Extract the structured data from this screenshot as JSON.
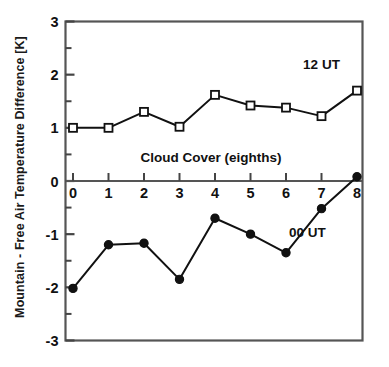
{
  "chart_data": {
    "type": "line",
    "title": "",
    "xlabel": "Cloud Cover (eighths)",
    "ylabel": "Mountain - Free Air Temperature Difference  [K]",
    "x": [
      0,
      1,
      2,
      3,
      4,
      5,
      6,
      7,
      8
    ],
    "xlim": [
      0,
      8
    ],
    "ylim": [
      -3,
      3
    ],
    "xticks": [
      "0",
      "1",
      "2",
      "3",
      "4",
      "5",
      "6",
      "7",
      "8"
    ],
    "yticks": [
      "3",
      "2",
      "1",
      "0",
      "-1",
      "-2",
      "-3"
    ],
    "ytick_values": [
      3,
      2,
      1,
      0,
      -1,
      -2,
      -3
    ],
    "yminor_step": 0.5,
    "grid": false,
    "legend_position": "inline-annotation",
    "series": [
      {
        "name": "12 UT",
        "marker": "open-square",
        "label_x": 7.0,
        "label_y": 2.1,
        "values": [
          1.0,
          1.0,
          1.3,
          1.02,
          1.62,
          1.42,
          1.38,
          1.22,
          1.7
        ]
      },
      {
        "name": "00 UT",
        "marker": "filled-circle",
        "label_x": 6.6,
        "label_y": -1.05,
        "values": [
          -2.02,
          -1.2,
          -1.17,
          -1.85,
          -0.7,
          -1.0,
          -1.35,
          -0.52,
          0.08
        ]
      }
    ],
    "colors": {
      "line": "#111111",
      "marker_fill_open": "#ffffff",
      "marker_fill_solid": "#111111",
      "axis": "#444444",
      "background": "#ffffff"
    }
  },
  "axis_title_x": "Cloud Cover (eighths)",
  "axis_title_y": "Mountain - Free Air Temperature Difference  [K]",
  "series_labels": {
    "upper": "12 UT",
    "lower": "00 UT"
  },
  "ytick_labels": [
    "3",
    "2",
    "1",
    "0",
    "-1",
    "-2",
    "-3"
  ],
  "xtick_labels": [
    "0",
    "1",
    "2",
    "3",
    "4",
    "5",
    "6",
    "7",
    "8"
  ]
}
